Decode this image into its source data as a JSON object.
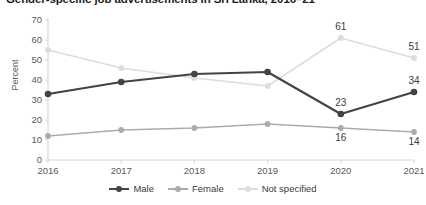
{
  "chart_data": {
    "type": "line",
    "title": "Gender-specific job advertisements in Sri Lanka, 2016–21",
    "xlabel": "",
    "ylabel": "Percent",
    "categories": [
      "2016",
      "2017",
      "2018",
      "2019",
      "2020",
      "2021"
    ],
    "ylim": [
      0,
      70
    ],
    "ytick_step": 10,
    "yticks": [
      "0",
      "10",
      "20",
      "30",
      "40",
      "50",
      "60",
      "70"
    ],
    "grid": false,
    "legend_position": "bottom-center",
    "series": [
      {
        "name": "Male",
        "color": "#434343",
        "values": [
          33,
          39,
          43,
          44,
          23,
          34
        ],
        "labels": [
          "",
          "",
          "",
          "",
          "23",
          "34"
        ]
      },
      {
        "name": "Female",
        "color": "#ababab",
        "values": [
          12,
          15,
          16,
          18,
          16,
          14
        ],
        "labels": [
          "",
          "",
          "",
          "",
          "16",
          "14"
        ]
      },
      {
        "name": "Not specified",
        "color": "#dddddd",
        "values": [
          55,
          46,
          41,
          37,
          61,
          51
        ],
        "labels": [
          "",
          "",
          "",
          "",
          "61",
          "51"
        ]
      }
    ]
  }
}
